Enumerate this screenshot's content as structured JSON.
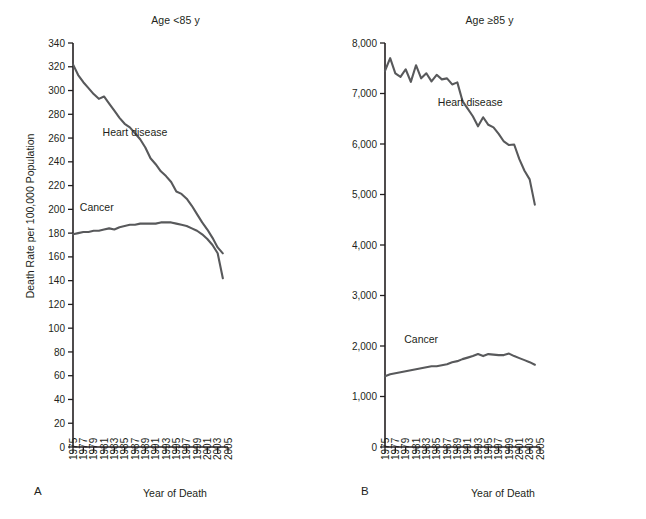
{
  "figure": {
    "panels": [
      {
        "letter": "A",
        "title": "Age <85 y",
        "xlabel": "Year of Death",
        "ylabel": "Death Rate per 100,000 Population",
        "show_ylabel": true
      },
      {
        "letter": "B",
        "title": "Age ≥85 y",
        "xlabel": "Year of Death",
        "ylabel": "",
        "show_ylabel": false
      }
    ]
  },
  "chart_data": [
    {
      "type": "line",
      "panel": "A",
      "title": "Age <85 y",
      "xlabel": "Year of Death",
      "ylabel": "Death Rate per 100,000 Population",
      "xlim": [
        1975,
        2005
      ],
      "ylim": [
        0,
        340
      ],
      "ytick_labels": [
        "0",
        "20",
        "40",
        "60",
        "80",
        "100",
        "120",
        "140",
        "160",
        "180",
        "200",
        "220",
        "240",
        "260",
        "280",
        "300",
        "320",
        "340"
      ],
      "yticks": [
        0,
        20,
        40,
        60,
        80,
        100,
        120,
        140,
        160,
        180,
        200,
        220,
        240,
        260,
        280,
        300,
        320,
        340
      ],
      "xtick_labels": [
        "1975",
        "1977",
        "1979",
        "1981",
        "1983",
        "1985",
        "1987",
        "1989",
        "1991",
        "1993",
        "1995",
        "1997",
        "1999",
        "2001",
        "2003",
        "2005"
      ],
      "xticks": [
        1975,
        1977,
        1979,
        1981,
        1983,
        1985,
        1987,
        1989,
        1991,
        1993,
        1995,
        1997,
        1999,
        2001,
        2003,
        2005
      ],
      "grid": false,
      "legend_position": "inline-annotation",
      "x": [
        1975,
        1976,
        1977,
        1978,
        1979,
        1980,
        1981,
        1982,
        1983,
        1984,
        1985,
        1986,
        1987,
        1988,
        1989,
        1990,
        1991,
        1992,
        1993,
        1994,
        1995,
        1996,
        1997,
        1998,
        1999,
        2000,
        2001,
        2002,
        2003,
        2004
      ],
      "series": [
        {
          "name": "Heart disease",
          "label_x": 1987.0,
          "label_y": 262,
          "values": [
            322,
            313,
            307,
            302,
            297,
            293,
            295,
            289,
            283,
            277,
            272,
            269,
            264,
            259,
            252,
            243,
            238,
            232,
            228,
            223,
            215,
            213,
            209,
            203,
            196,
            189,
            183,
            176,
            168,
            163
          ]
        },
        {
          "name": "Cancer",
          "label_x": 1979.6,
          "label_y": 199,
          "values": [
            179,
            180,
            181,
            181,
            182,
            182,
            183,
            184,
            183,
            185,
            186,
            187,
            187,
            188,
            188,
            188,
            188,
            189,
            189,
            189,
            188,
            187,
            186,
            184,
            182,
            179,
            175,
            170,
            163,
            142
          ]
        }
      ]
    },
    {
      "type": "line",
      "panel": "B",
      "title": "Age ≥85 y",
      "xlabel": "Year of Death",
      "ylabel": "",
      "xlim": [
        1975,
        2005
      ],
      "ylim": [
        0,
        8000
      ],
      "ytick_labels": [
        "0",
        "1,000",
        "2,000",
        "3,000",
        "4,000",
        "5,000",
        "6,000",
        "7,000",
        "8,000"
      ],
      "yticks": [
        0,
        1000,
        2000,
        3000,
        4000,
        5000,
        6000,
        7000,
        8000
      ],
      "xtick_labels": [
        "1975",
        "1977",
        "1979",
        "1981",
        "1983",
        "1985",
        "1987",
        "1989",
        "1991",
        "1993",
        "1995",
        "1997",
        "1999",
        "2001",
        "2003",
        "2005"
      ],
      "xticks": [
        1975,
        1977,
        1979,
        1981,
        1983,
        1985,
        1987,
        1989,
        1991,
        1993,
        1995,
        1997,
        1999,
        2001,
        2003,
        2005
      ],
      "grid": false,
      "legend_position": "inline-annotation",
      "x": [
        1975,
        1976,
        1977,
        1978,
        1979,
        1980,
        1981,
        1982,
        1983,
        1984,
        1985,
        1986,
        1987,
        1988,
        1989,
        1990,
        1991,
        1992,
        1993,
        1994,
        1995,
        1996,
        1997,
        1998,
        1999,
        2000,
        2001,
        2002,
        2003,
        2004
      ],
      "series": [
        {
          "name": "Heart disease",
          "label_x": 1991.5,
          "label_y": 6750,
          "values": [
            7450,
            7700,
            7400,
            7330,
            7480,
            7230,
            7560,
            7300,
            7400,
            7240,
            7370,
            7280,
            7300,
            7180,
            7220,
            6850,
            6700,
            6550,
            6350,
            6530,
            6380,
            6330,
            6200,
            6050,
            5980,
            5990,
            5700,
            5470,
            5300,
            4800
          ]
        },
        {
          "name": "Cancer",
          "label_x": 1982.0,
          "label_y": 2060,
          "values": [
            1400,
            1440,
            1460,
            1480,
            1500,
            1520,
            1540,
            1560,
            1580,
            1600,
            1600,
            1620,
            1640,
            1680,
            1700,
            1740,
            1770,
            1800,
            1840,
            1800,
            1840,
            1830,
            1820,
            1820,
            1850,
            1800,
            1760,
            1720,
            1680,
            1630
          ]
        }
      ]
    }
  ]
}
